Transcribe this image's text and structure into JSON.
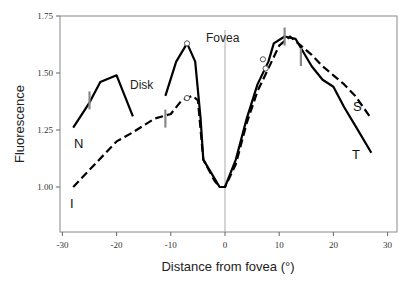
{
  "chart_data": {
    "type": "line",
    "title": "",
    "xlabel": "Distance from fovea (°)",
    "ylabel": "Fluorescence",
    "xlim": [
      -30,
      30
    ],
    "ylim": [
      0.8,
      1.75
    ],
    "x_ticks": [
      -30,
      -20,
      -10,
      0,
      10,
      20,
      30
    ],
    "x_tick_labels": [
      "-30",
      "-20",
      "-10",
      "0",
      "10",
      "20",
      "30"
    ],
    "y_ticks": [
      1.0,
      1.25,
      1.5,
      1.75
    ],
    "y_tick_labels": [
      "1.00",
      "1.25",
      "1.50",
      "1.75"
    ],
    "grid": false,
    "annotations": [
      {
        "text": "Fovea",
        "x": 0,
        "note": "vertical gray line at x=0"
      },
      {
        "text": "Disk",
        "x": -14,
        "y": 1.44
      }
    ],
    "series": [
      {
        "name": "N",
        "style": "solid",
        "x": [
          -28,
          -25,
          -23,
          -20,
          -17
        ],
        "values": [
          1.26,
          1.37,
          1.46,
          1.49,
          1.31
        ]
      },
      {
        "name": "T",
        "style": "solid",
        "x": [
          -11,
          -9,
          -7,
          -5.5,
          -4.5,
          -4,
          -2,
          -1,
          0,
          2,
          4,
          6,
          8,
          9,
          11,
          13,
          16,
          18,
          20,
          22,
          24,
          27
        ],
        "values": [
          1.4,
          1.55,
          1.63,
          1.55,
          1.3,
          1.12,
          1.04,
          1.0,
          1.0,
          1.12,
          1.3,
          1.45,
          1.55,
          1.63,
          1.66,
          1.65,
          1.53,
          1.47,
          1.44,
          1.35,
          1.27,
          1.15
        ]
      },
      {
        "name": "I / S",
        "style": "dashed",
        "x": [
          -28,
          -24,
          -20,
          -17,
          -13,
          -10,
          -8,
          -6,
          -5,
          -4,
          -2,
          -1,
          0,
          2,
          4,
          6,
          8,
          10,
          12,
          14,
          16,
          18,
          20,
          22,
          24,
          27
        ],
        "values": [
          1.0,
          1.1,
          1.2,
          1.24,
          1.3,
          1.32,
          1.38,
          1.4,
          1.38,
          1.12,
          1.03,
          1.0,
          1.0,
          1.1,
          1.28,
          1.42,
          1.52,
          1.62,
          1.66,
          1.62,
          1.58,
          1.53,
          1.49,
          1.45,
          1.4,
          1.3
        ]
      }
    ],
    "markers": {
      "open_circles": [
        {
          "x": -7,
          "y": 1.63,
          "series": "T"
        },
        {
          "x": -7,
          "y": 1.39,
          "series": "I / S"
        },
        {
          "x": 7,
          "y": 1.56,
          "series": "T"
        },
        {
          "x": 7.5,
          "y": 1.52,
          "series": "I / S"
        }
      ],
      "gray_ticks": [
        {
          "x": -25,
          "y": 1.38
        },
        {
          "x": -11,
          "y": 1.3
        },
        {
          "x": 11,
          "y": 1.66
        },
        {
          "x": 14,
          "y": 1.57
        }
      ]
    },
    "series_labels": [
      {
        "text": "N",
        "x": -28.5,
        "y": 1.14
      },
      {
        "text": "I",
        "x": -28.5,
        "y": 0.91
      },
      {
        "text": "S",
        "x": 28.5,
        "y": 1.36
      },
      {
        "text": "T",
        "x": 28.5,
        "y": 1.09
      }
    ]
  }
}
